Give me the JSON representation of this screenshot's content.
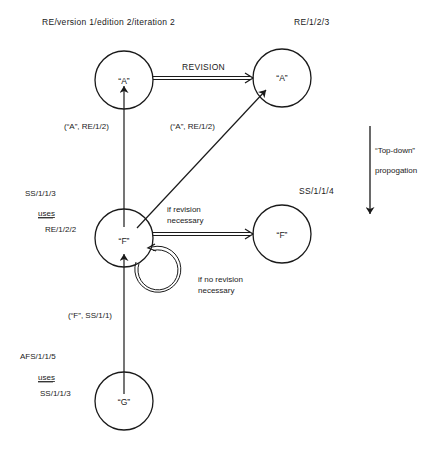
{
  "diagram": {
    "colors": {
      "ink": "#1a1a1a",
      "background": "#ffffff"
    },
    "headings": {
      "left_top": "RE/version 1/edition 2/iteration 2",
      "right_top": "RE/1/2/3",
      "right_mid": "SS/1/1/4"
    },
    "nodes": [
      {
        "id": "A1",
        "label": "“A”",
        "cx": 124,
        "cy": 80,
        "r": 29
      },
      {
        "id": "A2",
        "label": "“A”",
        "cx": 282,
        "cy": 78,
        "r": 29
      },
      {
        "id": "F1",
        "label": "“F”",
        "cx": 124,
        "cy": 238,
        "r": 29
      },
      {
        "id": "F2",
        "label": "“F”",
        "cx": 282,
        "cy": 234,
        "r": 29
      },
      {
        "id": "G",
        "label": "“G”",
        "cx": 124,
        "cy": 401,
        "r": 29
      }
    ],
    "edges": {
      "revision": "REVISION",
      "f_to_a1": "(“A”, RE/1/2)",
      "f_to_a2": "(“A”, RE/1/2)",
      "g_to_f": "(“F”, SS/1/1)",
      "if_revision_line1": "if revision",
      "if_revision_line2": "necessary",
      "if_no_revision_line1": "if no revision",
      "if_no_revision_line2": "necessary"
    },
    "annotations": {
      "f_block": {
        "line1": "SS/1/1/3",
        "uses": "uses",
        "line3": "RE/1/2/2"
      },
      "g_block": {
        "line1": "AFS/1/1/5",
        "uses": "uses",
        "line3": "SS/1/1/3"
      },
      "propagation_line1": "“Top-down”",
      "propagation_line2": "propogation"
    }
  }
}
